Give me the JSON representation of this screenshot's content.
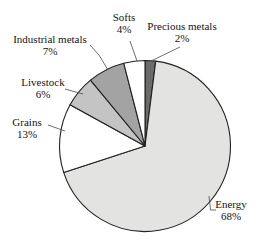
{
  "chart_data": {
    "type": "pie",
    "title": "",
    "start_angle_deg": 0,
    "direction": "clockwise",
    "legend_position": "none",
    "labels_outside": true,
    "background": "#ffffff",
    "stroke_color": "#222222",
    "slices": [
      {
        "label": "Precious metals",
        "value": 2,
        "pct": "2%",
        "color": "#6b6b6b"
      },
      {
        "label": "Energy",
        "value": 68,
        "pct": "68%",
        "color": "#e3e3e1"
      },
      {
        "label": "Grains",
        "value": 13,
        "pct": "13%",
        "color": "#ffffff"
      },
      {
        "label": "Livestock",
        "value": 6,
        "pct": "6%",
        "color": "#c4c4c4"
      },
      {
        "label": "Industrial metals",
        "value": 7,
        "pct": "7%",
        "color": "#a3a3a3"
      },
      {
        "label": "Softs",
        "value": 4,
        "pct": "4%",
        "color": "#ffffff"
      }
    ]
  }
}
